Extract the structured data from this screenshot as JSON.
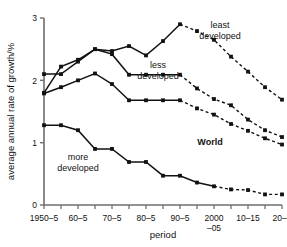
{
  "chart_data": {
    "type": "line",
    "title": "",
    "xlabel": "period",
    "ylabel": "average annual rate of growth/%",
    "categories": [
      "1950–5",
      "55–60",
      "60–5",
      "65–70",
      "70–5",
      "75–80",
      "80–5",
      "85–90",
      "90–5",
      "95–2000",
      "2000–05",
      "05–10",
      "10–15",
      "15–20",
      "20–5"
    ],
    "xtick_labels": [
      "1950–5",
      "60–5",
      "70–5",
      "80–5",
      "90–5",
      "2000\n–05",
      "10–15",
      "20–5"
    ],
    "xtick_label_lines": [
      [
        "1950–5"
      ],
      [
        "60–5"
      ],
      [
        "70–5"
      ],
      [
        "80–5"
      ],
      [
        "90–5"
      ],
      [
        "2000",
        "–05"
      ],
      [
        "10–15"
      ],
      [
        "20–5"
      ]
    ],
    "xtick_indices": [
      0,
      2,
      4,
      6,
      8,
      10,
      12,
      14
    ],
    "ytick_labels": [
      "0",
      "1",
      "2",
      "3"
    ],
    "ytick_values": [
      0,
      1,
      2,
      3
    ],
    "ylim": [
      0,
      3
    ],
    "grid": false,
    "legend_position": "inline-annotations",
    "marker": "filled-square",
    "series": [
      {
        "name": "least developed",
        "label": "least\ndeveloped",
        "label_lines": [
          "least",
          "developed"
        ],
        "color": "#111111",
        "solid_through_index": 8,
        "values": [
          1.8,
          2.22,
          2.33,
          2.5,
          2.47,
          2.55,
          2.4,
          2.63,
          2.9,
          2.79,
          2.65,
          2.38,
          2.14,
          1.89,
          1.69
        ]
      },
      {
        "name": "less developed",
        "label": "less\ndeveloped",
        "label_lines": [
          "less",
          "developed"
        ],
        "color": "#111111",
        "solid_through_index": 8,
        "values": [
          2.1,
          2.1,
          2.3,
          2.5,
          2.42,
          2.09,
          2.09,
          2.09,
          2.09,
          1.87,
          1.7,
          1.6,
          1.37,
          1.2,
          1.09
        ]
      },
      {
        "name": "World",
        "label": "World",
        "label_lines": [
          "World"
        ],
        "color": "#111111",
        "bold_label": true,
        "solid_through_index": 8,
        "values": [
          1.79,
          1.89,
          2.0,
          2.11,
          1.94,
          1.68,
          1.68,
          1.68,
          1.68,
          1.55,
          1.45,
          1.3,
          1.19,
          1.07,
          0.97
        ]
      },
      {
        "name": "more developed",
        "label": "more\ndeveloped",
        "label_lines": [
          "more",
          "developed"
        ],
        "color": "#111111",
        "solid_through_index": 10,
        "values": [
          1.28,
          1.28,
          1.2,
          0.9,
          0.9,
          0.69,
          0.69,
          0.47,
          0.47,
          0.36,
          0.3,
          0.25,
          0.24,
          0.17,
          0.17
        ]
      }
    ],
    "annotations": [
      {
        "name": "least-developed-label",
        "text_lines": [
          "least",
          "developed"
        ],
        "x": 220,
        "y": 28
      },
      {
        "name": "less-developed-label",
        "text_lines": [
          "less",
          "developed"
        ],
        "x": 158,
        "y": 68
      },
      {
        "name": "world-label",
        "text_lines": [
          "World"
        ],
        "x": 210,
        "y": 145,
        "bold": true
      },
      {
        "name": "more-developed-label",
        "text_lines": [
          "more",
          "developed"
        ],
        "x": 78,
        "y": 160
      }
    ]
  }
}
